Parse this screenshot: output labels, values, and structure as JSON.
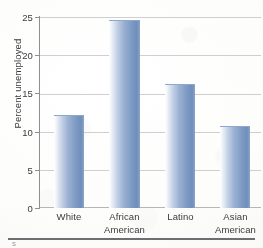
{
  "figure": {
    "footer_glyph": "s"
  },
  "chart_data": {
    "type": "bar",
    "title": "",
    "xlabel": "",
    "ylabel": "Percent unemployed",
    "categories": [
      "White",
      "African American",
      "Latino",
      "Asian American"
    ],
    "category_lines": [
      [
        "White",
        ""
      ],
      [
        "African",
        "American"
      ],
      [
        "Latino",
        ""
      ],
      [
        "Asian",
        "American"
      ]
    ],
    "values": [
      12.1,
      24.6,
      16.2,
      10.6
    ],
    "ylim": [
      0,
      25
    ],
    "yticks": [
      0,
      5,
      10,
      15,
      20,
      25
    ],
    "ytick_labels": [
      "0",
      "5",
      "10",
      "15",
      "20",
      "25"
    ],
    "grid": true,
    "legend": "none",
    "bar_color": "#7e9bc4",
    "grid_color": "#cfcfd2",
    "axis_color": "#8e8e93"
  }
}
